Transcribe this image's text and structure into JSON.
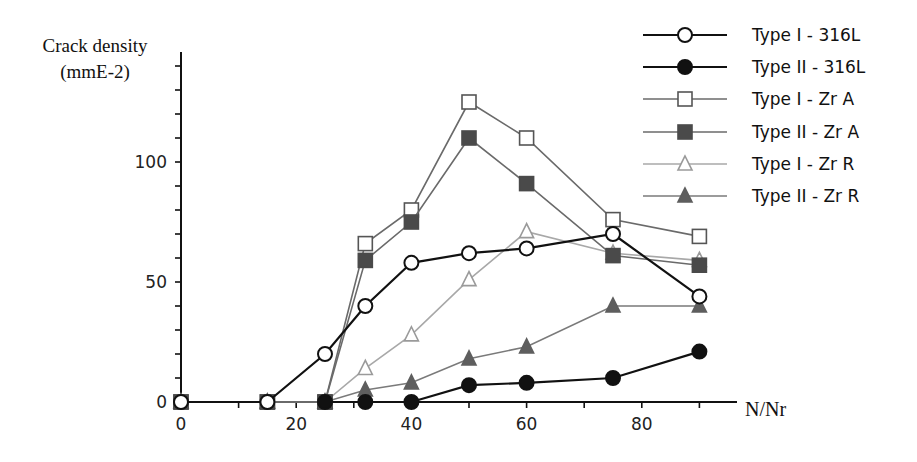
{
  "chart_data": {
    "type": "line",
    "title": "",
    "ylabel": "Crack density",
    "ylabel_unit": "(mmE-2)",
    "xlabel": "N/Nr",
    "xlim": [
      0,
      95
    ],
    "ylim": [
      0,
      145
    ],
    "x_ticks": [
      0,
      20,
      40,
      60,
      80
    ],
    "x_minor_ticks": [
      10,
      30,
      50,
      70,
      90
    ],
    "y_ticks": [
      0,
      50,
      100
    ],
    "y_minor_ticks": [
      10,
      20,
      30,
      40,
      60,
      70,
      80,
      90,
      110,
      120,
      130,
      140
    ],
    "grid": false,
    "legend_position": "upper right, outside plot",
    "series": [
      {
        "name": "Type I - 316L",
        "marker": "open-circle",
        "line_color": "#111111",
        "fill": "#ffffff",
        "stroke": "#111111",
        "line_width": 2.2,
        "x": [
          0,
          15,
          25,
          32,
          40,
          50,
          60,
          75,
          90
        ],
        "values": [
          0,
          0,
          20,
          40,
          58,
          62,
          64,
          70,
          44
        ]
      },
      {
        "name": "Type II - 316L",
        "marker": "filled-circle",
        "line_color": "#111111",
        "fill": "#111111",
        "stroke": "#111111",
        "line_width": 2.2,
        "x": [
          25,
          32,
          40,
          50,
          60,
          75,
          90
        ],
        "values": [
          0,
          0,
          0,
          7,
          8,
          10,
          21
        ]
      },
      {
        "name": "Type I - Zr A",
        "marker": "open-square",
        "line_color": "#6a6a6a",
        "fill": "#ffffff",
        "stroke": "#555555",
        "line_width": 1.6,
        "x": [
          0,
          15,
          25,
          32,
          40,
          50,
          60,
          75,
          90
        ],
        "values": [
          0,
          0,
          0,
          66,
          80,
          125,
          110,
          76,
          69
        ]
      },
      {
        "name": "Type II - Zr A",
        "marker": "filled-square",
        "line_color": "#6a6a6a",
        "fill": "#4a4a4a",
        "stroke": "#4a4a4a",
        "line_width": 1.6,
        "x": [
          0,
          15,
          25,
          32,
          40,
          50,
          60,
          75,
          90
        ],
        "values": [
          0,
          0,
          0,
          59,
          75,
          110,
          91,
          61,
          57
        ]
      },
      {
        "name": "Type I - Zr R",
        "marker": "open-triangle",
        "line_color": "#a8a8a8",
        "fill": "#ffffff",
        "stroke": "#9a9a9a",
        "line_width": 1.6,
        "x": [
          0,
          15,
          25,
          32,
          40,
          50,
          60,
          75,
          90
        ],
        "values": [
          0,
          0,
          0,
          14,
          28,
          51,
          71,
          62,
          59
        ]
      },
      {
        "name": "Type II - Zr R",
        "marker": "filled-triangle",
        "line_color": "#7a7a7a",
        "fill": "#5e5e5e",
        "stroke": "#5e5e5e",
        "line_width": 1.6,
        "x": [
          0,
          15,
          25,
          32,
          40,
          50,
          60,
          75,
          90
        ],
        "values": [
          0,
          0,
          0,
          5,
          8,
          18,
          23,
          40,
          40
        ]
      }
    ]
  },
  "axes": {
    "ylabel_line1": "Crack density",
    "ylabel_line2": "(mmE-2)",
    "xlabel": "N/Nr"
  },
  "legend": {
    "items": [
      {
        "label": "Type I - 316L"
      },
      {
        "label": "Type II - 316L"
      },
      {
        "label": "Type I - Zr A"
      },
      {
        "label": "Type II - Zr A"
      },
      {
        "label": "Type I - Zr R"
      },
      {
        "label": "Type II - Zr R"
      }
    ]
  }
}
